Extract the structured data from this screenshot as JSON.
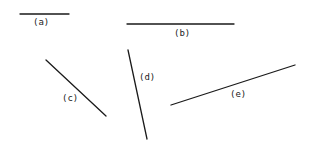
{
  "diagram": {
    "segments": [
      {
        "id": "a",
        "label": "(a)",
        "x1": 20,
        "y1": 14,
        "x2": 69,
        "y2": 14,
        "lx": 33,
        "ly": 25
      },
      {
        "id": "b",
        "label": "(b)",
        "x1": 127,
        "y1": 24,
        "x2": 234,
        "y2": 24,
        "lx": 174,
        "ly": 36
      },
      {
        "id": "c",
        "label": "(c)",
        "x1": 46,
        "y1": 60,
        "x2": 106,
        "y2": 116,
        "lx": 62,
        "ly": 101
      },
      {
        "id": "d",
        "label": "(d)",
        "x1": 128,
        "y1": 50,
        "x2": 147,
        "y2": 139,
        "lx": 139,
        "ly": 80
      },
      {
        "id": "e",
        "label": "(e)",
        "x1": 171,
        "y1": 105,
        "x2": 295,
        "y2": 65,
        "lx": 230,
        "ly": 97
      }
    ],
    "line_color": "#1a1a1a",
    "label_color": "#222222"
  }
}
